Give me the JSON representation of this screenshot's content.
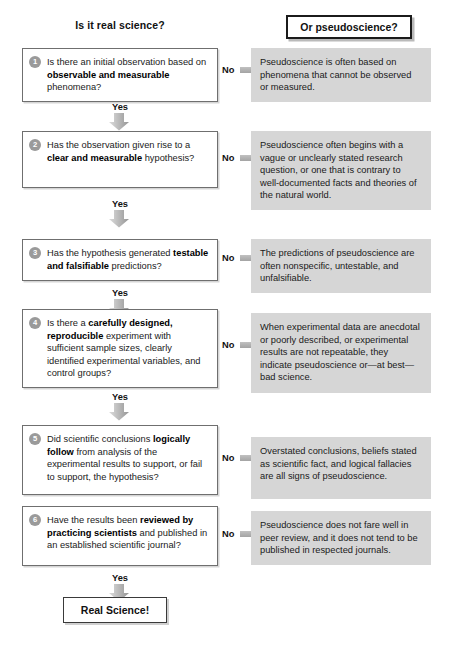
{
  "headers": {
    "left": "Is it real science?",
    "right": "Or pseudoscience?"
  },
  "labels": {
    "no": "No",
    "yes": "Yes"
  },
  "final": {
    "label": "Real Science!"
  },
  "steps": [
    {
      "number": "1",
      "question_html": "Is there an initial observation based on <b>observable and measurable</b> phenomena?",
      "answer": "Pseudoscience is often based on phenomena that cannot be observed or measured."
    },
    {
      "number": "2",
      "question_html": "Has the observation given rise to a <b>clear and measurable</b> hypothesis?",
      "answer": "Pseudoscience often begins with a vague or unclearly stated research question, or one that is contrary to well-documented facts and theories of the natural world."
    },
    {
      "number": "3",
      "question_html": "Has the hypothesis generated <b>testable and falsifiable</b> predictions?",
      "answer": "The predictions of pseudoscience are often nonspecific, untestable, and unfalsifiable."
    },
    {
      "number": "4",
      "question_html": "Is there a <b>carefully designed, reproducible</b> experiment with sufficient sample sizes, clearly identified experimental variables, and control groups?",
      "answer": "When experimental data are anecdotal or poorly described, or experimental results are not repeatable, they indicate pseudoscience or—at best—bad science."
    },
    {
      "number": "5",
      "question_html": "Did scientific conclusions <b>logically follow</b> from analysis of the experimental results to support, or fail to support, the hypothesis?",
      "answer": "Overstated conclusions, beliefs stated as scientific fact, and logical fallacies are all signs of pseudoscience."
    },
    {
      "number": "6",
      "question_html": "Have the results been <b>reviewed by practicing scientists</b> and published in an established scientific journal?",
      "answer": "Pseudoscience does not fare well in peer review, and it does not tend to be published in respected journals."
    }
  ],
  "colors": {
    "panel_gray": "#d6d6d6",
    "badge_gray": "#9a9a9a",
    "arrow_gray": "#b3b3b3",
    "box_border": "#6f6f6f",
    "text": "#1a1a1a"
  },
  "layout": {
    "qbox_tops": [
      48,
      131,
      239,
      309,
      425,
      506
    ],
    "qbox_heights": [
      48,
      57,
      42,
      76,
      70,
      60
    ],
    "apanel_tops": [
      48,
      131,
      239,
      313,
      437,
      511
    ],
    "apanel_heights": [
      48,
      70,
      44,
      80,
      62,
      50
    ],
    "arrow_rows": [
      70,
      158,
      258,
      345,
      458,
      534
    ],
    "yes_tops": [
      102,
      199,
      288,
      392,
      504,
      573
    ],
    "down_arrow_tops": [
      113,
      210,
      299,
      403,
      515,
      584
    ]
  }
}
